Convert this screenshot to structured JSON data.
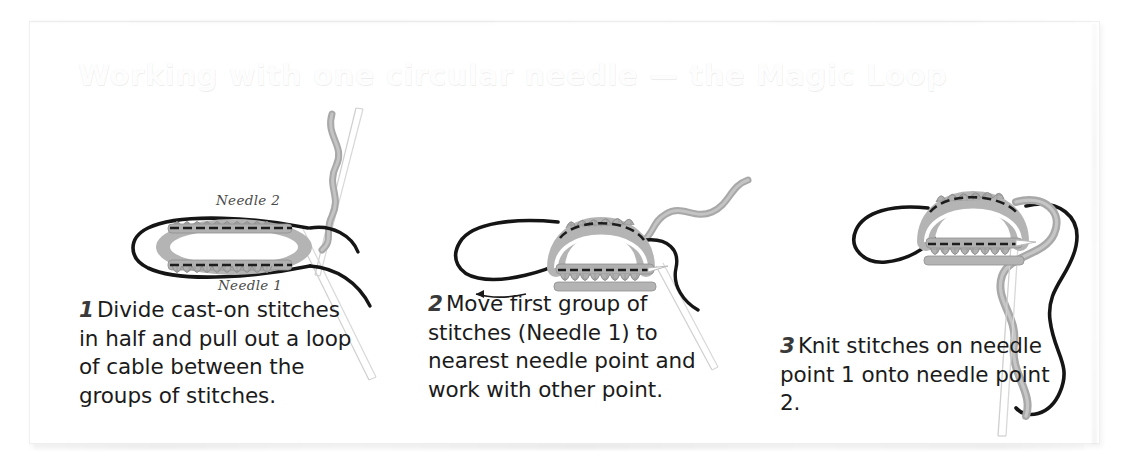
{
  "page": {
    "heading": "Working with one circular needle — the Magic Loop",
    "background_color": "#ffffff",
    "panel_border_color": "#f0f0f0",
    "heading_color": "#fdfdfd",
    "caption_text_color": "#1b1b1b",
    "illustration_yarn_color": "#a8a8a8",
    "illustration_cable_color": "#1a1a1a",
    "illustration_needle_color": "#d8d8d8"
  },
  "steps": [
    {
      "number": "1",
      "caption": "Divide cast-on stitches in half and pull out a loop of cable between the groups of stitches.",
      "illustration_name": "magic-loop-step-1-illustration",
      "labels": [
        {
          "text": "Needle 2",
          "position": "top"
        },
        {
          "text": "Needle 1",
          "position": "bottom"
        }
      ]
    },
    {
      "number": "2",
      "caption": "Move first group of stitches (Needle 1) to nearest needle point and work with other point.",
      "illustration_name": "magic-loop-step-2-illustration",
      "labels": []
    },
    {
      "number": "3",
      "caption": "Knit stitches on needle point 1 onto needle point 2.",
      "illustration_name": "magic-loop-step-3-illustration",
      "labels": []
    }
  ]
}
